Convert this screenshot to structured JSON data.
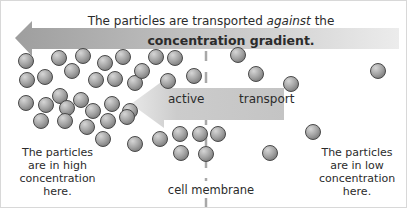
{
  "header": {
    "line1_prefix": "The particles are transported ",
    "line1_emphasis": "against",
    "line1_suffix": " the",
    "line2": "concentration gradient."
  },
  "arrows": {
    "main_arrow": {
      "direction": "left",
      "color": "#a8a8a8"
    },
    "inner_arrow": {
      "direction": "left",
      "label_left": "active",
      "label_right": "transport",
      "color": "#c4c4c4"
    }
  },
  "labels": {
    "high": [
      "The particles",
      "are in high",
      "concentration",
      "here."
    ],
    "low": [
      "The particles",
      "are in low",
      "concentration",
      "here."
    ],
    "membrane": "cell membrane"
  },
  "colors": {
    "particle_fill": "#9a9a9a",
    "particle_stroke": "#4a4a4a",
    "membrane": "#a0a0a0",
    "text": "#2b2b2b"
  },
  "particles": [
    [
      25,
      60
    ],
    [
      58,
      57
    ],
    [
      82,
      55
    ],
    [
      104,
      62
    ],
    [
      122,
      56
    ],
    [
      155,
      56
    ],
    [
      174,
      57
    ],
    [
      237,
      54
    ],
    [
      26,
      79
    ],
    [
      44,
      76
    ],
    [
      71,
      70
    ],
    [
      95,
      79
    ],
    [
      114,
      78
    ],
    [
      134,
      82
    ],
    [
      141,
      70
    ],
    [
      167,
      80
    ],
    [
      193,
      75
    ],
    [
      255,
      73
    ],
    [
      290,
      83
    ],
    [
      377,
      70
    ],
    [
      59,
      95
    ],
    [
      80,
      99
    ],
    [
      25,
      102
    ],
    [
      45,
      104
    ],
    [
      66,
      107
    ],
    [
      92,
      110
    ],
    [
      111,
      103
    ],
    [
      129,
      110
    ],
    [
      40,
      120
    ],
    [
      64,
      120
    ],
    [
      86,
      126
    ],
    [
      107,
      120
    ],
    [
      126,
      116
    ],
    [
      102,
      138
    ],
    [
      134,
      143
    ],
    [
      159,
      138
    ],
    [
      179,
      133
    ],
    [
      199,
      133
    ],
    [
      180,
      152
    ],
    [
      205,
      153
    ],
    [
      217,
      133
    ],
    [
      269,
      152
    ],
    [
      312,
      131
    ]
  ]
}
